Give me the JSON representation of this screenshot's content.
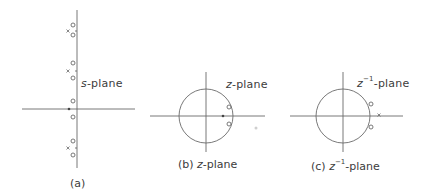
{
  "figure": {
    "panels": [
      {
        "id": "a",
        "plane_label_var": "s",
        "plane_label_suffix": "-plane",
        "caption": "(a)",
        "poles": [
          "x",
          "x",
          "x",
          "x"
        ],
        "zeros": [
          "o",
          "o",
          "o",
          "o",
          "o",
          "o",
          "o",
          "o"
        ]
      },
      {
        "id": "b",
        "plane_label_var": "z",
        "plane_label_suffix": "-plane",
        "caption_prefix": "(b) ",
        "caption_var": "z",
        "caption_suffix": "-plane",
        "unit_circle": true
      },
      {
        "id": "c",
        "plane_label_var": "z",
        "plane_label_sup": "−1",
        "plane_label_suffix": "-plane",
        "caption_prefix": "(c) ",
        "caption_var": "z",
        "caption_sup": "−1",
        "caption_suffix": "-plane",
        "unit_circle": true
      }
    ],
    "colors": {
      "line": "#6a6a6a",
      "text": "#3c3c3c",
      "background": "#ffffff"
    }
  }
}
